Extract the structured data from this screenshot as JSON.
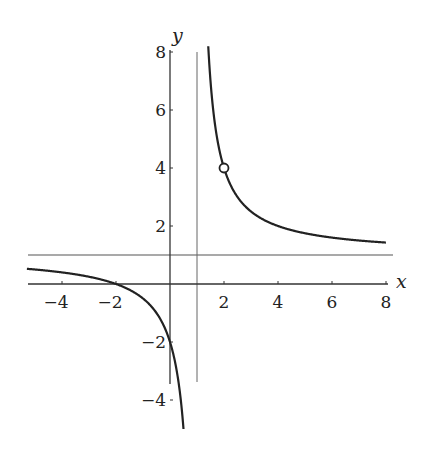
{
  "chart_data": {
    "type": "line",
    "title": "",
    "function": "y = (x + 2) / (x - 1)",
    "xlabel": "x",
    "ylabel": "y",
    "xlim": [
      -5.3,
      8.2
    ],
    "ylim": [
      -5,
      8.2
    ],
    "x_ticks": [
      -4,
      -2,
      2,
      4,
      6,
      8
    ],
    "y_ticks": [
      -4,
      -2,
      2,
      4,
      6,
      8
    ],
    "x_tick_labels": [
      "-4",
      "-2",
      "2",
      "4",
      "6",
      "8"
    ],
    "y_tick_labels": [
      "-4",
      "-2",
      "2",
      "4",
      "6",
      "8"
    ],
    "asymptotes": {
      "vertical": 1,
      "horizontal": 1
    },
    "hole": {
      "x": 2,
      "y": 4
    },
    "key_points": [
      {
        "x": -2,
        "y": 0
      },
      {
        "x": 0,
        "y": -2
      },
      {
        "x": 2,
        "y": 4
      }
    ],
    "series": [
      {
        "name": "left branch",
        "x": [
          -5.3,
          -4,
          -3,
          -2,
          -1,
          -0.5,
          0,
          0.2,
          0.4
        ],
        "values": [
          0.49,
          0.4,
          0.25,
          0,
          -0.5,
          -1,
          -2,
          -2.75,
          -4
        ]
      },
      {
        "name": "right branch",
        "x": [
          1.4,
          1.5,
          2,
          3,
          4,
          5,
          6,
          7,
          8
        ],
        "values": [
          8.5,
          7,
          4,
          2.5,
          2,
          1.75,
          1.6,
          1.5,
          1.43
        ]
      }
    ],
    "grid": false,
    "legend": null
  }
}
